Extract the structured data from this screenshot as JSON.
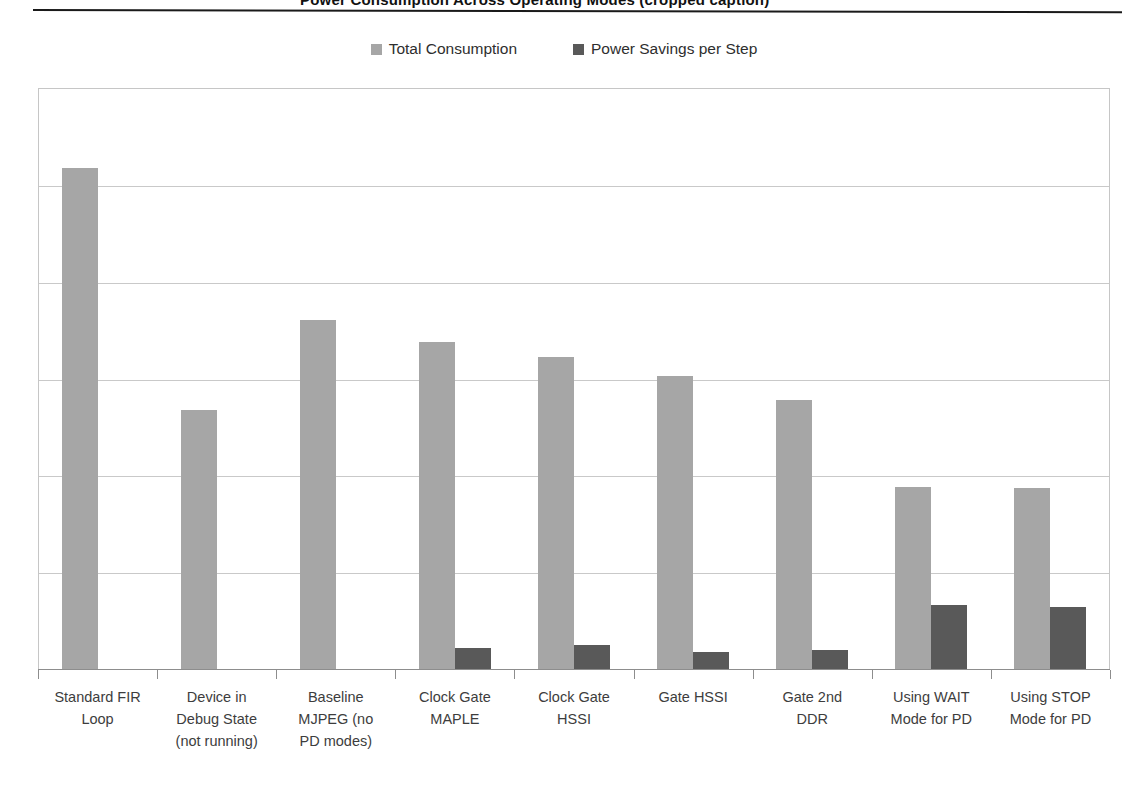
{
  "top_caption": {
    "text": "Power Consumption Across Operating Modes (cropped caption)"
  },
  "legend": {
    "position": "top-center",
    "entries": [
      {
        "label": "Total Consumption",
        "color": "#a6a6a6",
        "swatch_name": "legend-swatch-total-consumption"
      },
      {
        "label": "Power Savings per Step",
        "color": "#595959",
        "swatch_name": "legend-swatch-power-savings"
      }
    ]
  },
  "chart_data": {
    "type": "bar",
    "title": "",
    "subtitle": "",
    "xlabel": "",
    "ylabel": "",
    "grid": true,
    "legend_position": "top-center",
    "ylim": [
      0,
      120
    ],
    "yticks": [
      0,
      20,
      40,
      60,
      80,
      100,
      120
    ],
    "ytick_labels": [
      "",
      "",
      "",
      "",
      "",
      "",
      ""
    ],
    "categories": [
      "Standard FIR Loop",
      "Device in Debug State (not running)",
      "Baseline MJPEG (no PD modes)",
      "Clock Gate MAPLE",
      "Clock Gate HSSI",
      "Gate HSSI",
      "Gate 2nd DDR",
      "Using WAIT Mode for PD",
      "Using STOP Mode for PD"
    ],
    "category_lines": [
      [
        "Standard FIR",
        "Loop"
      ],
      [
        "Device in",
        "Debug State",
        "(not running)"
      ],
      [
        "Baseline",
        "MJPEG (no",
        "PD modes)"
      ],
      [
        "Clock Gate",
        "MAPLE"
      ],
      [
        "Clock Gate",
        "HSSI"
      ],
      [
        "Gate HSSI"
      ],
      [
        "Gate 2nd",
        "DDR"
      ],
      [
        "Using WAIT",
        "Mode for PD"
      ],
      [
        "Using STOP",
        "Mode for PD"
      ]
    ],
    "series": [
      {
        "name": "Total Consumption",
        "color": "#a6a6a6",
        "values": [
          103.5,
          53.5,
          72.0,
          67.5,
          64.5,
          60.5,
          55.5,
          37.5,
          37.3
        ]
      },
      {
        "name": "Power Savings per Step",
        "color": "#595959",
        "values": [
          0,
          0,
          0,
          4.3,
          5.0,
          3.5,
          3.9,
          13.2,
          12.8
        ]
      }
    ]
  },
  "colors": {
    "total_consumption": "#a6a6a6",
    "power_savings": "#595959",
    "gridline": "#c9c9c9",
    "axis": "#8d8d8d",
    "rule": "#1a1a1a",
    "text": "#3d3d3d",
    "background": "#ffffff"
  }
}
